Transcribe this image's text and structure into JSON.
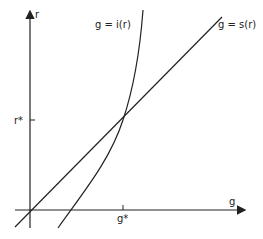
{
  "diagram": {
    "axes": {
      "y_label": "r",
      "x_label": "g",
      "r_star_label": "r*",
      "g_star_label": "g*"
    },
    "curves": {
      "investment": {
        "label": "g = i(r)"
      },
      "saving": {
        "label": "g = s(r)"
      }
    },
    "colors": {
      "ink": "#222222",
      "background": "#ffffff"
    }
  }
}
